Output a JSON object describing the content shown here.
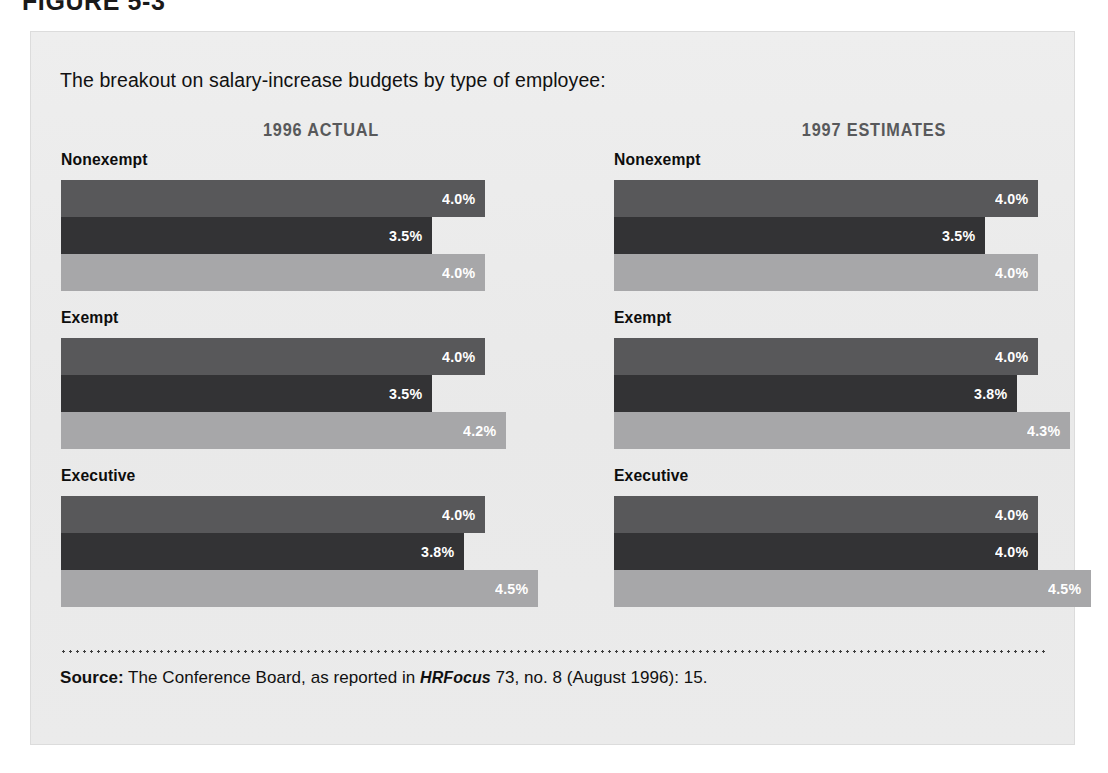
{
  "figure": {
    "caption": "FIGURE 5-3",
    "intro": "The breakout on salary-increase budgets by type of employee:"
  },
  "columns": [
    {
      "header": "1996 ACTUAL"
    },
    {
      "header": "1997 ESTIMATES"
    }
  ],
  "groups": {
    "nonexempt": "Nonexempt",
    "exempt": "Exempt",
    "executive": "Executive"
  },
  "source": {
    "label": "Source:",
    "text_before": " The Conference Board, as reported in ",
    "italic": "HRFocus",
    "text_after": " 73, no. 8 (August 1996): 15."
  },
  "colors": {
    "series_0": "#58585a",
    "series_1": "#333335",
    "series_2": "#a7a7a9",
    "panel_bg": "#ececec",
    "header_text": "#58595b"
  },
  "chart_data": {
    "type": "bar",
    "title": "The breakout on salary-increase budgets by type of employee:",
    "orientation": "horizontal",
    "xlabel": "",
    "ylabel": "",
    "xlim": [
      0,
      4.6
    ],
    "grid": false,
    "legend": "none",
    "value_suffix": "%",
    "panels": [
      {
        "name": "1996 ACTUAL",
        "categories": [
          "Nonexempt",
          "Exempt",
          "Executive"
        ],
        "series": [
          {
            "name": "series-1",
            "color": "#58585a",
            "values": [
              4.0,
              4.0,
              4.0
            ],
            "labels": [
              "4.0%",
              "4.0%",
              "4.0%"
            ]
          },
          {
            "name": "series-2",
            "color": "#333335",
            "values": [
              3.5,
              3.5,
              3.8
            ],
            "labels": [
              "3.5%",
              "3.5%",
              "3.8%"
            ]
          },
          {
            "name": "series-3",
            "color": "#a7a7a9",
            "values": [
              4.0,
              4.2,
              4.5
            ],
            "labels": [
              "4.0%",
              "4.2%",
              "4.5%"
            ]
          }
        ]
      },
      {
        "name": "1997 ESTIMATES",
        "categories": [
          "Nonexempt",
          "Exempt",
          "Executive"
        ],
        "series": [
          {
            "name": "series-1",
            "color": "#58585a",
            "values": [
              4.0,
              4.0,
              4.0
            ],
            "labels": [
              "4.0%",
              "4.0%",
              "4.0%"
            ]
          },
          {
            "name": "series-2",
            "color": "#333335",
            "values": [
              3.5,
              3.8,
              4.0
            ],
            "labels": [
              "3.5%",
              "3.8%",
              "4.0%"
            ]
          },
          {
            "name": "series-3",
            "color": "#a7a7a9",
            "values": [
              4.0,
              4.3,
              4.5
            ],
            "labels": [
              "4.0%",
              "4.3%",
              "4.5%"
            ]
          }
        ]
      }
    ]
  }
}
